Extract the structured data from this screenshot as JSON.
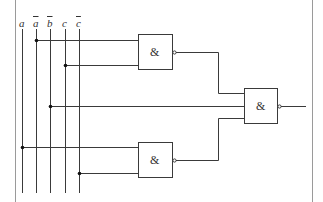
{
  "diagram": {
    "type": "logic-circuit",
    "inputs": [
      {
        "label": "a",
        "negated": false,
        "x": 22
      },
      {
        "label": "a",
        "negated": true,
        "x": 36
      },
      {
        "label": "b",
        "negated": true,
        "x": 50
      },
      {
        "label": "c",
        "negated": false,
        "x": 65
      },
      {
        "label": "c",
        "negated": true,
        "x": 79
      }
    ],
    "gates": [
      {
        "id": "g1",
        "symbol": "&",
        "kind": "NAND",
        "inputs": [
          "a_bar",
          "c"
        ]
      },
      {
        "id": "g2",
        "symbol": "&",
        "kind": "NAND",
        "inputs": [
          "a",
          "c_bar"
        ]
      },
      {
        "id": "g3",
        "symbol": "&",
        "kind": "NAND",
        "inputs": [
          "g1",
          "b_bar",
          "g2"
        ]
      }
    ],
    "colors": {
      "line": "#3a3a3a",
      "frame": "#9a9a9a",
      "background": "#ffffff"
    }
  }
}
